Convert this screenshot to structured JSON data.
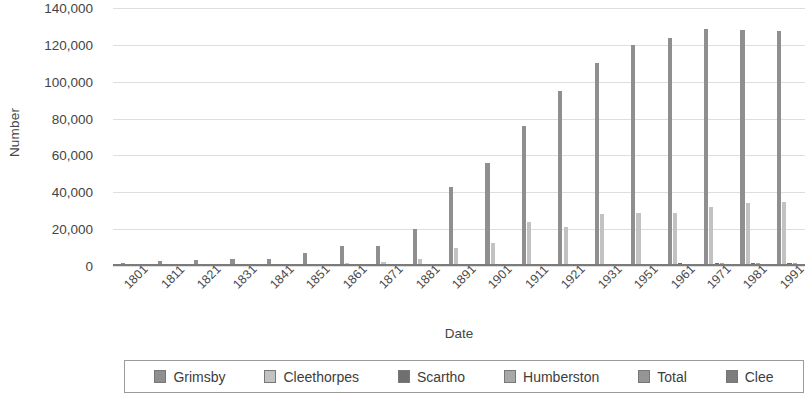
{
  "chart_data": {
    "type": "bar",
    "title": "",
    "xlabel": "Date",
    "ylabel": "Number",
    "ylim": [
      0,
      140000
    ],
    "ytick_labels": [
      "140,000",
      "120,000",
      "100,000",
      "80,000",
      "60,000",
      "40,000",
      "20,000",
      "0"
    ],
    "ytick_values": [
      140000,
      120000,
      100000,
      80000,
      60000,
      40000,
      20000,
      0
    ],
    "grid": true,
    "legend_position": "bottom",
    "categories": [
      "1801",
      "1811",
      "1821",
      "1831",
      "1841",
      "1851",
      "1861",
      "1871",
      "1881",
      "1891",
      "1901",
      "1911",
      "1921",
      "1931",
      "1951",
      "1961",
      "1971",
      "1981",
      "1991"
    ],
    "series": [
      {
        "name": "Grimsby",
        "color": "#8f8f8f",
        "values": [
          1524,
          2747,
          3064,
          4048,
          3700,
          6880,
          11067,
          11067,
          20244,
          43000,
          56000,
          76000,
          95000,
          110000,
          120000,
          123800,
          128500,
          128000,
          127500
        ]
      },
      {
        "name": "Cleethorpes",
        "color": "#c2c2c2",
        "values": [
          284,
          338,
          406,
          598,
          745,
          1286,
          1731,
          2049,
          3694,
          10000,
          12600,
          24000,
          21000,
          28000,
          28500,
          29000,
          32000,
          34000,
          34500
        ]
      },
      {
        "name": "Scartho",
        "color": "#6f6f6f",
        "values": [
          163,
          180,
          213,
          246,
          271,
          312,
          340,
          350,
          400,
          450,
          500,
          620,
          750,
          900,
          1200,
          1400,
          1600,
          1700,
          1800
        ]
      },
      {
        "name": "Humberston",
        "color": "#a8a8a8",
        "values": [
          170,
          195,
          220,
          240,
          260,
          290,
          320,
          330,
          360,
          400,
          430,
          500,
          600,
          800,
          1000,
          1200,
          1400,
          1500,
          1600
        ]
      },
      {
        "name": "Total",
        "color": "#959595",
        "values": [
          2141,
          3460,
          3903,
          5132,
          4976,
          8768,
          13458,
          13796,
          24698,
          53893,
          69530,
          101120,
          117350,
          139700,
          150700,
          155400,
          163500,
          165200,
          165400
        ]
      },
      {
        "name": "Clee",
        "color": "#7d7d7d",
        "values": [
          0,
          0,
          0,
          0,
          0,
          0,
          0,
          0,
          0,
          0,
          0,
          0,
          0,
          0,
          0,
          0,
          0,
          0,
          0
        ]
      }
    ],
    "plot_bars": [
      {
        "category": "1801",
        "bars": [
          1524,
          284,
          163,
          170
        ]
      },
      {
        "category": "1811",
        "bars": [
          2747,
          338,
          180,
          195
        ]
      },
      {
        "category": "1821",
        "bars": [
          3064,
          406,
          213,
          220
        ]
      },
      {
        "category": "1831",
        "bars": [
          4048,
          598,
          246,
          240
        ]
      },
      {
        "category": "1841",
        "bars": [
          3700,
          745,
          271,
          260
        ]
      },
      {
        "category": "1851",
        "bars": [
          6880,
          1286,
          312,
          290
        ]
      },
      {
        "category": "1861",
        "bars": [
          11067,
          1731,
          340,
          320
        ]
      },
      {
        "category": "1871",
        "bars": [
          11067,
          2049,
          350,
          330
        ]
      },
      {
        "category": "1881",
        "bars": [
          20244,
          3694,
          400,
          360
        ]
      },
      {
        "category": "1891",
        "bars": [
          43000,
          10000,
          450,
          400
        ]
      },
      {
        "category": "1901",
        "bars": [
          56000,
          12600,
          500,
          430
        ]
      },
      {
        "category": "1911",
        "bars": [
          76000,
          24000,
          620,
          500
        ]
      },
      {
        "category": "1921",
        "bars": [
          95000,
          21000,
          750,
          600
        ]
      },
      {
        "category": "1931",
        "bars": [
          110000,
          28000,
          900,
          800
        ]
      },
      {
        "category": "1951",
        "bars": [
          120000,
          28500,
          1200,
          1000
        ]
      },
      {
        "category": "1961",
        "bars": [
          123800,
          29000,
          1400,
          1200
        ]
      },
      {
        "category": "1971",
        "bars": [
          128500,
          32000,
          1600,
          1400
        ]
      },
      {
        "category": "1981",
        "bars": [
          128000,
          34000,
          1700,
          1500
        ]
      },
      {
        "category": "1991",
        "bars": [
          127500,
          34500,
          1800,
          1600
        ]
      }
    ]
  },
  "legend": {
    "items": [
      {
        "label": "Grimsby",
        "swatch": "#8f8f8f"
      },
      {
        "label": "Cleethorpes",
        "swatch": "#c2c2c2"
      },
      {
        "label": "Scartho",
        "swatch": "#6f6f6f"
      },
      {
        "label": "Humberston",
        "swatch": "#a8a8a8"
      },
      {
        "label": "Total",
        "swatch": "#959595"
      },
      {
        "label": "Clee",
        "swatch": "#7d7d7d"
      }
    ]
  }
}
